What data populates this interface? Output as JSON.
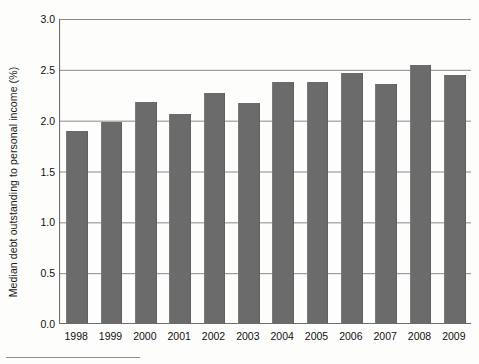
{
  "chart_data": {
    "type": "bar",
    "title": "",
    "xlabel": "",
    "ylabel": "Median debt outstanding to personal income (%)",
    "categories": [
      "1998",
      "1999",
      "2000",
      "2001",
      "2002",
      "2003",
      "2004",
      "2005",
      "2006",
      "2007",
      "2008",
      "2009"
    ],
    "values": [
      1.9,
      1.99,
      2.18,
      2.07,
      2.27,
      2.17,
      2.38,
      2.38,
      2.47,
      2.36,
      2.55,
      2.45
    ],
    "ylim": [
      0.0,
      3.0
    ],
    "yticks": [
      0.0,
      0.5,
      1.0,
      1.5,
      2.0,
      2.5,
      3.0
    ],
    "ytick_labels": [
      "0.0",
      "0.5",
      "1.0",
      "1.5",
      "2.0",
      "2.5",
      "3.0"
    ],
    "grid": true,
    "grid_axis": "y",
    "legend": "none",
    "bar_color": "#6b6b6b",
    "axis_color": "#6f6f6f",
    "grid_color": "#8a8a8a",
    "text_color": "#111111",
    "background": "#fdfdfc"
  }
}
